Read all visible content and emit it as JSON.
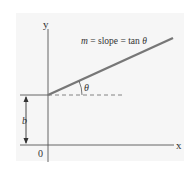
{
  "diagram": {
    "axes": {
      "x_label": "x",
      "y_label": "y",
      "origin_label": "0"
    },
    "line": {
      "equation_label": "m = slope = tan θ",
      "m": "m",
      "rest": " = slope = tan ",
      "theta": "θ",
      "color": "#777777"
    },
    "angle_label": "θ",
    "intercept_label": "b",
    "colors": {
      "background_panel": "#f6f6f6",
      "axis": "#555555",
      "line": "#777777",
      "dashed": "#777777"
    }
  }
}
